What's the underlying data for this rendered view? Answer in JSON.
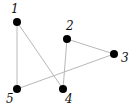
{
  "graph": {
    "nodes": [
      {
        "id": "1",
        "label": "1",
        "x": 17,
        "y": 22,
        "lx": 11,
        "ly": 13
      },
      {
        "id": "2",
        "label": "2",
        "x": 67,
        "y": 39,
        "lx": 66,
        "ly": 30
      },
      {
        "id": "3",
        "label": "3",
        "x": 114,
        "y": 54,
        "lx": 121,
        "ly": 62
      },
      {
        "id": "4",
        "label": "4",
        "x": 63,
        "y": 89,
        "lx": 65,
        "ly": 103
      },
      {
        "id": "5",
        "label": "5",
        "x": 17,
        "y": 89,
        "lx": 6,
        "ly": 103
      }
    ],
    "edges": [
      {
        "from": "1",
        "to": "5"
      },
      {
        "from": "1",
        "to": "4"
      },
      {
        "from": "2",
        "to": "4"
      },
      {
        "from": "2",
        "to": "3"
      },
      {
        "from": "3",
        "to": "5"
      }
    ],
    "colors": {
      "node": "#000000",
      "edge": "#b8b8b8",
      "label": "#111111"
    }
  }
}
